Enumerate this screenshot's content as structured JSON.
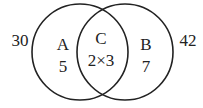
{
  "diagram": {
    "type": "venn",
    "outside_left": "30",
    "outside_right": "42",
    "circle_a": {
      "name": "A",
      "value": "5"
    },
    "intersection": {
      "name": "C",
      "value": "2×3"
    },
    "circle_b": {
      "name": "B",
      "value": "7"
    },
    "stroke_color": "#222222"
  }
}
